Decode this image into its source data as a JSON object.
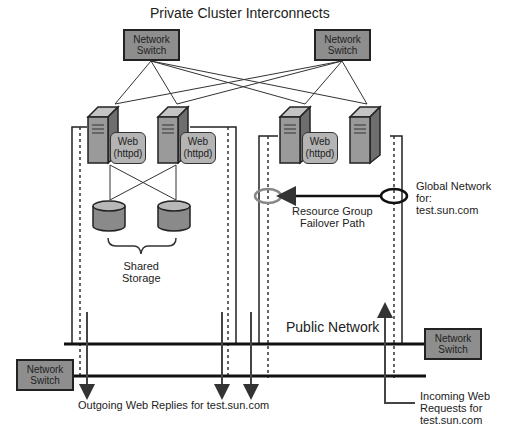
{
  "title": "Private Cluster Interconnects",
  "switches": {
    "top_left": "Network Switch",
    "top_right": "Network Switch",
    "bottom_left": "Network Switch",
    "right": "Network Switch"
  },
  "web_labels": [
    {
      "line1": "Web",
      "line2": "(httpd)"
    },
    {
      "line1": "Web",
      "line2": "(httpd)"
    },
    {
      "line1": "Web",
      "line2": "(httpd)"
    }
  ],
  "shared_storage": {
    "line1": "Shared",
    "line2": "Storage"
  },
  "failover": {
    "line1": "Resource Group",
    "line2": "Failover Path"
  },
  "global_network": {
    "line1": "Global Network",
    "line2": "for:",
    "line3": "test.sun.com"
  },
  "public_network": "Public Network",
  "outgoing": "Outgoing Web Replies for test.sun.com",
  "incoming": {
    "line1": "Incoming Web",
    "line2": "Requests for",
    "line3": "test.sun.com"
  },
  "colors": {
    "switch_fill": "#8e8e8e",
    "server_fill": "#9a9a9a",
    "web_fill": "#b4b4b4",
    "failover_oval": "#888888"
  }
}
